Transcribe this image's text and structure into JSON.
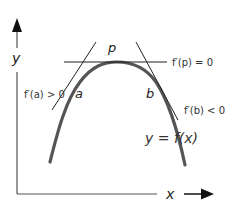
{
  "diagram": {
    "axes": {
      "x_label": "x",
      "y_label": "y"
    },
    "points": {
      "a": "a",
      "p": "p",
      "b": "b"
    },
    "annotations": {
      "slope_a": "f′(a) > 0",
      "slope_p": "f′(p) = 0",
      "slope_b": "f′(b) < 0",
      "function": "y = f(x)"
    },
    "colors": {
      "curve": "#555555",
      "tangent": "#222222",
      "axis": "#555555",
      "arrow": "#111111"
    }
  }
}
